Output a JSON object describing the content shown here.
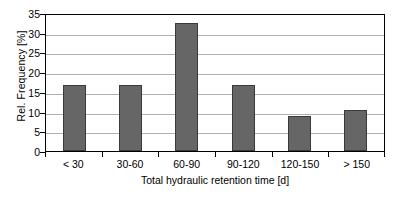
{
  "chart_data": {
    "type": "bar",
    "title": "",
    "subtitle": "",
    "xlabel": "Total hydraulic retention time [d]",
    "ylabel": "Rel. Frequency [%]",
    "categories": [
      "< 30",
      "30-60",
      "60-90",
      "90-120",
      "120-150",
      "> 150"
    ],
    "values": [
      16.7,
      16.7,
      32.5,
      16.7,
      9.0,
      10.5
    ],
    "series": [
      {
        "name": "Rel. Frequency",
        "values": [
          16.7,
          16.7,
          32.5,
          16.7,
          9.0,
          10.5
        ]
      }
    ],
    "ylim": [
      0,
      35
    ],
    "yticks": [
      0,
      5,
      10,
      15,
      20,
      25,
      30,
      35
    ],
    "ytick_labels": [
      "0",
      "5",
      "10",
      "15",
      "20",
      "25",
      "30",
      "35"
    ],
    "grid": "horizontal",
    "legend": "none",
    "bar_color": "#666666",
    "bar_edge_color": "#3a3a3a",
    "gridline_color": "#b0b0b0",
    "axis_color": "#000000",
    "plot_background": "#ffffff",
    "annotations": []
  }
}
